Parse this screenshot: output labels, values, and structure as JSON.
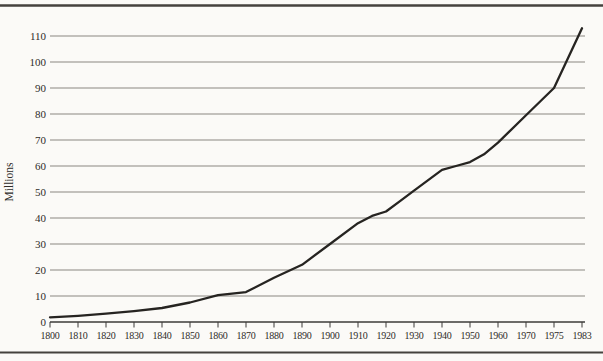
{
  "chart_data": {
    "type": "line",
    "title": "",
    "xlabel": "",
    "ylabel": "Millions",
    "ylim": [
      0,
      115
    ],
    "grid": "horizontal",
    "legend": "none",
    "x_tick_labels": [
      "1800",
      "1810",
      "1820",
      "1830",
      "1840",
      "1850",
      "1860",
      "1870",
      "1880",
      "1890",
      "1900",
      "1910",
      "1920",
      "1930",
      "1940",
      "1950",
      "1960",
      "1970",
      "1975",
      "1983"
    ],
    "y_ticks": [
      0,
      10,
      20,
      30,
      40,
      50,
      60,
      70,
      80,
      90,
      100,
      110
    ],
    "values_at_x_ticks": [
      1.8,
      2.4,
      3.2,
      4.2,
      5.4,
      7.5,
      10.3,
      11.5,
      17,
      22,
      30,
      38,
      42.5,
      50.5,
      58.5,
      61.5,
      69,
      79.5,
      90,
      113
    ],
    "series": [
      {
        "name": "growth-curve",
        "points": [
          [
            1800,
            1.8
          ],
          [
            1810,
            2.4
          ],
          [
            1820,
            3.2
          ],
          [
            1830,
            4.2
          ],
          [
            1840,
            5.4
          ],
          [
            1850,
            7.5
          ],
          [
            1860,
            10.3
          ],
          [
            1865,
            10.9
          ],
          [
            1870,
            11.5
          ],
          [
            1880,
            17
          ],
          [
            1890,
            22
          ],
          [
            1900,
            30
          ],
          [
            1910,
            38
          ],
          [
            1915,
            40.8
          ],
          [
            1920,
            42.5
          ],
          [
            1925,
            46.5
          ],
          [
            1930,
            50.5
          ],
          [
            1940,
            58.5
          ],
          [
            1945,
            60
          ],
          [
            1950,
            61.5
          ],
          [
            1955,
            64.5
          ],
          [
            1960,
            69
          ],
          [
            1970,
            79.5
          ],
          [
            1975,
            90
          ],
          [
            1983,
            113
          ]
        ]
      }
    ]
  },
  "colors": {
    "paper": "#fbfaf7",
    "ink": "#2e2c29",
    "curve": "#262421",
    "gridline": "#8a8781",
    "axis": "#3d3b38",
    "rule": "#45423e"
  }
}
